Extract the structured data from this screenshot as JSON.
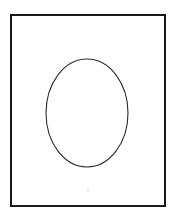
{
  "figure": {
    "canvas": {
      "width": 176,
      "height": 212,
      "background_color": "#ffffff"
    },
    "frame": {
      "name": "rectangular-border",
      "x": 11,
      "y": 15,
      "width": 154,
      "height": 191,
      "stroke_color": "#1a1a1a",
      "stroke_width": 2,
      "fill": "none"
    },
    "ellipse": {
      "name": "oval-outline",
      "center_x": 87,
      "center_y": 113,
      "radius_x": 41,
      "radius_y": 54,
      "stroke_color": "#2b2b2b",
      "stroke_width": 1.1,
      "fill": "none"
    },
    "speck": {
      "name": "faint-speck",
      "center_x": 88,
      "center_y": 190,
      "radius": 1.1,
      "color": "#d8d8d8"
    }
  }
}
